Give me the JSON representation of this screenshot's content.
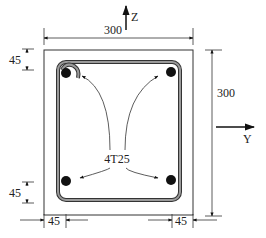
{
  "diagram": {
    "type": "reinforced-concrete-column-cross-section",
    "section": {
      "width": 300,
      "height": 300
    },
    "dimensions": {
      "top_width": "300",
      "right_height": "300",
      "top_cover": "45",
      "bottom_cover": "45",
      "left_cover": "45",
      "right_cover": "45"
    },
    "axes": {
      "vertical": "Z",
      "horizontal": "Y"
    },
    "reinforcement": {
      "label": "4T25",
      "bar_count": 4
    },
    "colors": {
      "line": "#222222",
      "stirrup_fill": "#9a9a9a",
      "bar": "#111111"
    }
  }
}
